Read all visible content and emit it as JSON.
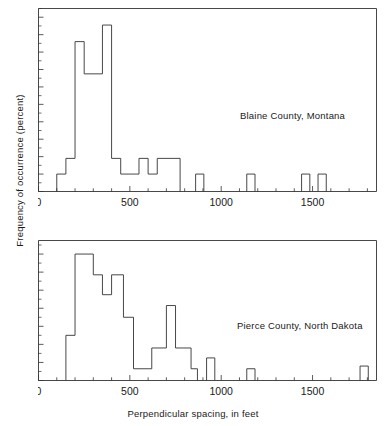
{
  "figure": {
    "xlabel": "Perpendicular spacing, in feet",
    "ylabel": "Frequency of occurrence (percent)"
  },
  "chart_data": [
    {
      "type": "bar",
      "title": "Blaine County, Montana",
      "annotation": "Blaine County, Montana",
      "xlabel": "",
      "ylabel": "Frequency of occurrence (percent)",
      "xlim": [
        0,
        1850
      ],
      "ylim": [
        0,
        21
      ],
      "xticks": [
        0,
        500,
        1000,
        1500
      ],
      "xticklabels": [
        "0",
        "500",
        "1000",
        "1500"
      ],
      "xminortick_step": 100,
      "yticks": [
        0,
        2,
        4,
        6,
        8,
        10,
        12,
        14,
        16,
        18,
        20
      ],
      "yticklabels": [
        "0",
        "2",
        "4",
        "6",
        "8",
        "10",
        "12",
        "14",
        "16",
        "18",
        "20"
      ],
      "grid": false,
      "legend": "none",
      "bin_width": 50,
      "bin_edges": [
        100,
        150,
        200,
        250,
        300,
        350,
        400,
        450,
        500,
        550,
        600,
        650,
        700,
        750,
        800,
        850,
        900,
        1150,
        1200,
        1450,
        1500,
        1550,
        1600
      ],
      "bars": [
        {
          "x0": 100,
          "x1": 150,
          "value": 2.0
        },
        {
          "x0": 150,
          "x1": 200,
          "value": 3.8
        },
        {
          "x0": 200,
          "x1": 250,
          "value": 17.2
        },
        {
          "x0": 250,
          "x1": 350,
          "value": 13.5
        },
        {
          "x0": 350,
          "x1": 400,
          "value": 19.1
        },
        {
          "x0": 400,
          "x1": 450,
          "value": 3.8
        },
        {
          "x0": 450,
          "x1": 550,
          "value": 2.0
        },
        {
          "x0": 550,
          "x1": 600,
          "value": 3.8
        },
        {
          "x0": 600,
          "x1": 650,
          "value": 2.0
        },
        {
          "x0": 650,
          "x1": 775,
          "value": 3.8
        },
        {
          "x0": 860,
          "x1": 905,
          "value": 2.0
        },
        {
          "x0": 1140,
          "x1": 1185,
          "value": 2.0
        },
        {
          "x0": 1440,
          "x1": 1485,
          "value": 2.0
        },
        {
          "x0": 1530,
          "x1": 1575,
          "value": 2.0
        }
      ]
    },
    {
      "type": "bar",
      "title": "Pierce County, North Dakota",
      "annotation": "Pierce County, North Dakota",
      "xlabel": "Perpendicular spacing, in feet",
      "ylabel": "Frequency of occurrence (percent)",
      "xlim": [
        0,
        1850
      ],
      "ylim": [
        0,
        15.5
      ],
      "xticks": [
        0,
        500,
        1000,
        1500
      ],
      "xticklabels": [
        "0",
        "500",
        "1000",
        "1500"
      ],
      "xminortick_step": 100,
      "yticks": [
        0,
        2,
        4,
        6,
        8,
        10,
        12,
        14
      ],
      "yticklabels": [
        "0",
        "2",
        "4",
        "6",
        "8",
        "10",
        "12",
        "14"
      ],
      "grid": false,
      "legend": "none",
      "bin_width": 50,
      "bin_edges": [
        150,
        200,
        250,
        300,
        350,
        400,
        450,
        500,
        550,
        600,
        650,
        700,
        750,
        800,
        850,
        900,
        950,
        1000,
        1150,
        1200,
        1750,
        1800
      ],
      "bars": [
        {
          "x0": 150,
          "x1": 200,
          "value": 5.0
        },
        {
          "x0": 200,
          "x1": 300,
          "value": 14.0
        },
        {
          "x0": 300,
          "x1": 350,
          "value": 11.7
        },
        {
          "x0": 350,
          "x1": 400,
          "value": 9.5
        },
        {
          "x0": 400,
          "x1": 465,
          "value": 11.7
        },
        {
          "x0": 465,
          "x1": 520,
          "value": 7.0
        },
        {
          "x0": 520,
          "x1": 620,
          "value": 1.3
        },
        {
          "x0": 620,
          "x1": 700,
          "value": 3.6
        },
        {
          "x0": 700,
          "x1": 750,
          "value": 8.3
        },
        {
          "x0": 750,
          "x1": 835,
          "value": 3.6
        },
        {
          "x0": 835,
          "x1": 870,
          "value": 1.3
        },
        {
          "x0": 920,
          "x1": 965,
          "value": 2.5
        },
        {
          "x0": 1140,
          "x1": 1185,
          "value": 1.3
        },
        {
          "x0": 1760,
          "x1": 1805,
          "value": 1.6
        }
      ]
    }
  ]
}
